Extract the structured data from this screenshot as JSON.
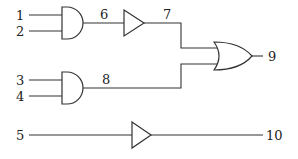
{
  "diagram": {
    "type": "logic-circuit",
    "inputs": [
      {
        "id": "1",
        "label": "1"
      },
      {
        "id": "2",
        "label": "2"
      },
      {
        "id": "3",
        "label": "3"
      },
      {
        "id": "4",
        "label": "4"
      },
      {
        "id": "5",
        "label": "5"
      }
    ],
    "wires": {
      "w6": "6",
      "w7": "7",
      "w8": "8",
      "w9": "9",
      "w10": "10"
    },
    "gates": [
      {
        "id": "and1",
        "type": "AND",
        "inputs": [
          "1",
          "2"
        ],
        "output": "6"
      },
      {
        "id": "buf1",
        "type": "BUFFER",
        "inputs": [
          "6"
        ],
        "output": "7"
      },
      {
        "id": "and2",
        "type": "AND",
        "inputs": [
          "3",
          "4"
        ],
        "output": "8"
      },
      {
        "id": "or1",
        "type": "OR",
        "inputs": [
          "7",
          "8"
        ],
        "output": "9"
      },
      {
        "id": "buf2",
        "type": "BUFFER",
        "inputs": [
          "5"
        ],
        "output": "10"
      }
    ]
  }
}
